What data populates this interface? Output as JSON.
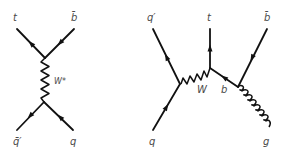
{
  "diagrams": [
    {
      "name": "s-channel",
      "labels": {
        "top_left": "t",
        "top_right": "b̄",
        "propagator": "W*",
        "bottom_left": "q̄′",
        "bottom_right": "q"
      }
    },
    {
      "name": "t-channel-with-gluon",
      "labels": {
        "top_left": "q′",
        "top_middle": "t",
        "top_right": "b̄",
        "w_boson": "W",
        "b_quark": "b",
        "bottom_left": "q",
        "bottom_right": "g"
      }
    }
  ],
  "colors": {
    "line": "#111111",
    "label": "#4a4a4a",
    "background": "#ffffff"
  }
}
